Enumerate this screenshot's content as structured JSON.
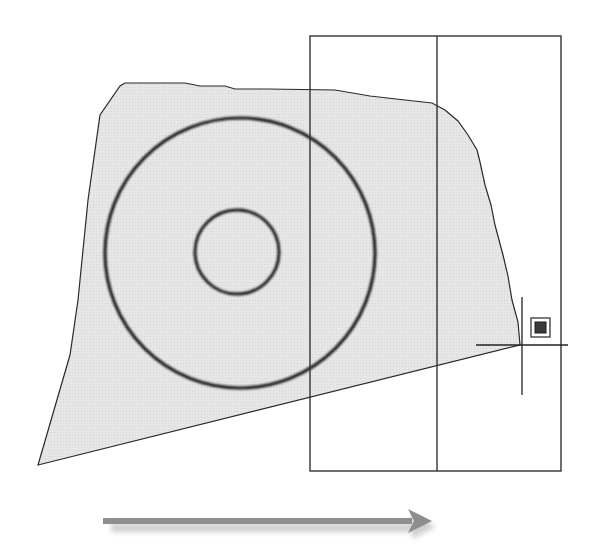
{
  "diagram": {
    "colors": {
      "background": "#ffffff",
      "fill": "#e4e4e4",
      "outline": "#2a2a2a",
      "circle_stroke": "#1a1a1a",
      "arrow": "#8c8c8c",
      "arrow_shadow": "#cfcfcf"
    },
    "region": {
      "points": "38,465 70,355 78,300 88,200 100,115 120,86 125,83 185,83 200,86 225,86 235,89 268,89 335,90 370,96 405,100 432,103 445,110 458,121 468,135 477,150 480,162 485,185 491,205 495,225 503,255 508,276 512,300 518,322 520,345"
    },
    "circles": [
      {
        "name": "outer-circle",
        "cx": 240,
        "cy": 253,
        "r": 135
      },
      {
        "name": "inner-circle",
        "cx": 237,
        "cy": 252,
        "r": 42
      }
    ],
    "selection_window": {
      "x": 310,
      "y": 36,
      "width": 251,
      "height": 435,
      "divider_x": 437
    },
    "crosshair": {
      "x": 522,
      "y": 345,
      "h_half": 46,
      "v_up": 48,
      "v_down": 50
    },
    "snap_marker": {
      "x": 531,
      "y": 318,
      "size": 19,
      "icon": "endpoint-snap-icon"
    },
    "arrow": {
      "x1": 103,
      "x2": 432,
      "y": 522,
      "direction": "right"
    }
  }
}
